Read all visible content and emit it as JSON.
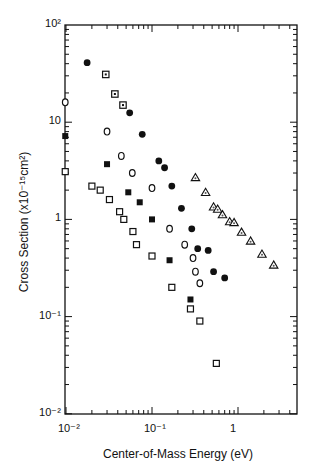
{
  "chart_data": {
    "type": "scatter",
    "title": "",
    "xlabel": "Center-of-Mass Energy (eV)",
    "ylabel": "Cross Section (x10⁻¹⁵cm²)",
    "xscale": "log",
    "yscale": "log",
    "xlim": [
      0.009,
      4.5
    ],
    "ylim": [
      0.01,
      100
    ],
    "x_ticks": [
      {
        "value": 0.01,
        "label": "10⁻²"
      },
      {
        "value": 0.1,
        "label": "10⁻¹"
      },
      {
        "value": 1,
        "label": "1"
      }
    ],
    "y_ticks": [
      {
        "value": 100,
        "label": "10²"
      },
      {
        "value": 10,
        "label": "10"
      },
      {
        "value": 1,
        "label": "1"
      },
      {
        "value": 0.1,
        "label": "10⁻¹"
      },
      {
        "value": 0.01,
        "label": "10⁻²"
      }
    ],
    "grid": false,
    "legend": null,
    "series": [
      {
        "name": "filled-circles",
        "marker": "filled-circle",
        "points": [
          [
            0.0176,
            41
          ],
          [
            0.055,
            12.5
          ],
          [
            0.077,
            7.5
          ],
          [
            0.12,
            4.0
          ],
          [
            0.14,
            3.4
          ],
          [
            0.17,
            2.2
          ],
          [
            0.22,
            1.3
          ],
          [
            0.29,
            0.8
          ],
          [
            0.34,
            0.5
          ],
          [
            0.45,
            0.48
          ],
          [
            0.52,
            0.29
          ],
          [
            0.7,
            0.25
          ]
        ]
      },
      {
        "name": "dotted-squares",
        "marker": "dotted-square",
        "points": [
          [
            0.029,
            31
          ],
          [
            0.037,
            19.5
          ],
          [
            0.046,
            15
          ]
        ]
      },
      {
        "name": "open-circles",
        "marker": "open-circle",
        "points": [
          [
            0.0098,
            16
          ],
          [
            0.03,
            8
          ],
          [
            0.044,
            4.5
          ],
          [
            0.059,
            3.0
          ],
          [
            0.1,
            2.1
          ],
          [
            0.16,
            0.8
          ],
          [
            0.24,
            0.55
          ],
          [
            0.3,
            0.4
          ],
          [
            0.32,
            0.29
          ],
          [
            0.36,
            0.22
          ]
        ]
      },
      {
        "name": "filled-squares",
        "marker": "filled-square",
        "points": [
          [
            0.0098,
            7.2
          ],
          [
            0.03,
            3.7
          ],
          [
            0.053,
            1.9
          ],
          [
            0.072,
            1.5
          ],
          [
            0.1,
            1.0
          ],
          [
            0.16,
            0.38
          ],
          [
            0.28,
            0.15
          ]
        ]
      },
      {
        "name": "open-squares",
        "marker": "open-square",
        "points": [
          [
            0.0098,
            3.1
          ],
          [
            0.02,
            2.2
          ],
          [
            0.025,
            2.0
          ],
          [
            0.032,
            1.6
          ],
          [
            0.042,
            1.2
          ],
          [
            0.047,
            1.0
          ],
          [
            0.06,
            0.75
          ],
          [
            0.066,
            0.55
          ],
          [
            0.1,
            0.42
          ],
          [
            0.17,
            0.2
          ],
          [
            0.28,
            0.12
          ],
          [
            0.36,
            0.09
          ],
          [
            0.56,
            0.033
          ]
        ]
      },
      {
        "name": "triangles",
        "marker": "dotted-triangle",
        "points": [
          [
            0.32,
            2.7
          ],
          [
            0.42,
            1.9
          ],
          [
            0.52,
            1.35
          ],
          [
            0.58,
            1.28
          ],
          [
            0.66,
            1.12
          ],
          [
            0.8,
            0.95
          ],
          [
            0.9,
            0.93
          ],
          [
            1.1,
            0.74
          ],
          [
            1.4,
            0.6
          ],
          [
            1.9,
            0.44
          ],
          [
            2.6,
            0.34
          ]
        ]
      }
    ]
  }
}
